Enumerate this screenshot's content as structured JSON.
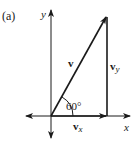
{
  "figure": {
    "panel_label": "(a)",
    "axes": {
      "x_label": "x",
      "y_label": "y"
    },
    "vectors": {
      "v": {
        "label": "v",
        "magnitude_dir": "60° from +x axis"
      },
      "vx": {
        "label_base": "v",
        "label_sub": "x"
      },
      "vy": {
        "label_base": "v",
        "label_sub": "y"
      }
    },
    "angle": {
      "label": "60°",
      "value_deg": 60
    },
    "colors": {
      "ink": "#1a1a1a",
      "background": "#ffffff"
    }
  }
}
